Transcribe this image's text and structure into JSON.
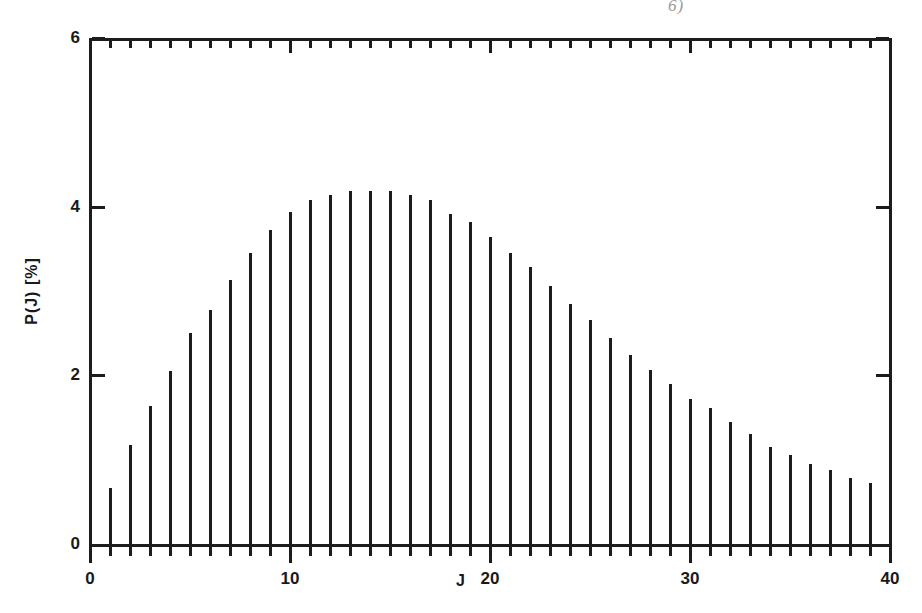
{
  "figure": {
    "scan_artifact": "6)",
    "background_color": "#ffffff",
    "ink_color": "#1c1c1c"
  },
  "chart_data": {
    "type": "bar",
    "title": "",
    "subtitle": "",
    "xlabel": "J",
    "ylabel": "P(J) [%]",
    "xlim": [
      0,
      40
    ],
    "ylim": [
      0,
      6
    ],
    "x_major_ticks": [
      0,
      10,
      20,
      30,
      40
    ],
    "x_major_tick_labels": [
      "0",
      "10",
      "20",
      "30",
      "40"
    ],
    "x_minor_tick_step": 1,
    "y_major_ticks": [
      0,
      2,
      4,
      6
    ],
    "y_major_tick_labels": [
      "0",
      "2",
      "4",
      "6"
    ],
    "grid": false,
    "legend": null,
    "bar_style": "impulse / stick",
    "categories": [
      1,
      2,
      3,
      4,
      5,
      6,
      7,
      8,
      9,
      10,
      11,
      12,
      13,
      14,
      15,
      16,
      17,
      18,
      19,
      20,
      21,
      22,
      23,
      24,
      25,
      26,
      27,
      28,
      29,
      30,
      31,
      32,
      33,
      34,
      35,
      36,
      37,
      38,
      39,
      40
    ],
    "values": [
      0.66,
      1.17,
      1.64,
      2.05,
      2.5,
      2.78,
      3.13,
      3.45,
      3.72,
      3.94,
      4.08,
      4.14,
      4.19,
      4.19,
      4.19,
      4.14,
      4.08,
      3.91,
      3.82,
      3.64,
      3.45,
      3.28,
      3.06,
      2.85,
      2.66,
      2.44,
      2.24,
      2.06,
      1.9,
      1.72,
      1.61,
      1.45,
      1.3,
      1.15,
      1.05,
      0.95,
      0.88,
      0.78,
      0.72,
      0.66
    ]
  }
}
